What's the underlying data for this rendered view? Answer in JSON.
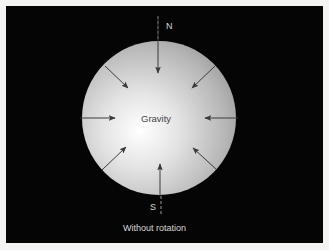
{
  "diagram": {
    "center_label": "Gravity",
    "north_label": "N",
    "south_label": "S",
    "caption": "Without rotation",
    "colors": {
      "background": "#050505",
      "frame": "#f4f4f2",
      "sphere_highlight": "#ffffff",
      "sphere_edge": "#9a9a9a",
      "arrow": "#3a3a3a",
      "label_light": "#d8d8d8",
      "label_dark": "#444444"
    },
    "sphere": {
      "cx": 159,
      "cy": 118,
      "r": 77
    },
    "arrows": [
      {
        "name": "arrow-north",
        "x1": 158,
        "y1": 16,
        "x2": 158,
        "y2": 73
      },
      {
        "name": "arrow-northeast",
        "x1": 215,
        "y1": 66,
        "x2": 192,
        "y2": 88
      },
      {
        "name": "arrow-east",
        "x1": 238,
        "y1": 118,
        "x2": 205,
        "y2": 118
      },
      {
        "name": "arrow-southeast",
        "x1": 217,
        "y1": 170,
        "x2": 193,
        "y2": 148
      },
      {
        "name": "arrow-south",
        "x1": 160,
        "y1": 196,
        "x2": 160,
        "y2": 164
      },
      {
        "name": "arrow-southwest",
        "x1": 102,
        "y1": 170,
        "x2": 126,
        "y2": 147
      },
      {
        "name": "arrow-west",
        "x1": 80,
        "y1": 118,
        "x2": 115,
        "y2": 118
      },
      {
        "name": "arrow-northwest",
        "x1": 105,
        "y1": 66,
        "x2": 128,
        "y2": 88
      }
    ],
    "axis": {
      "x": 159,
      "top_y1": 16,
      "top_y2": 42,
      "bottom_y1": 196,
      "bottom_y2": 214
    }
  }
}
